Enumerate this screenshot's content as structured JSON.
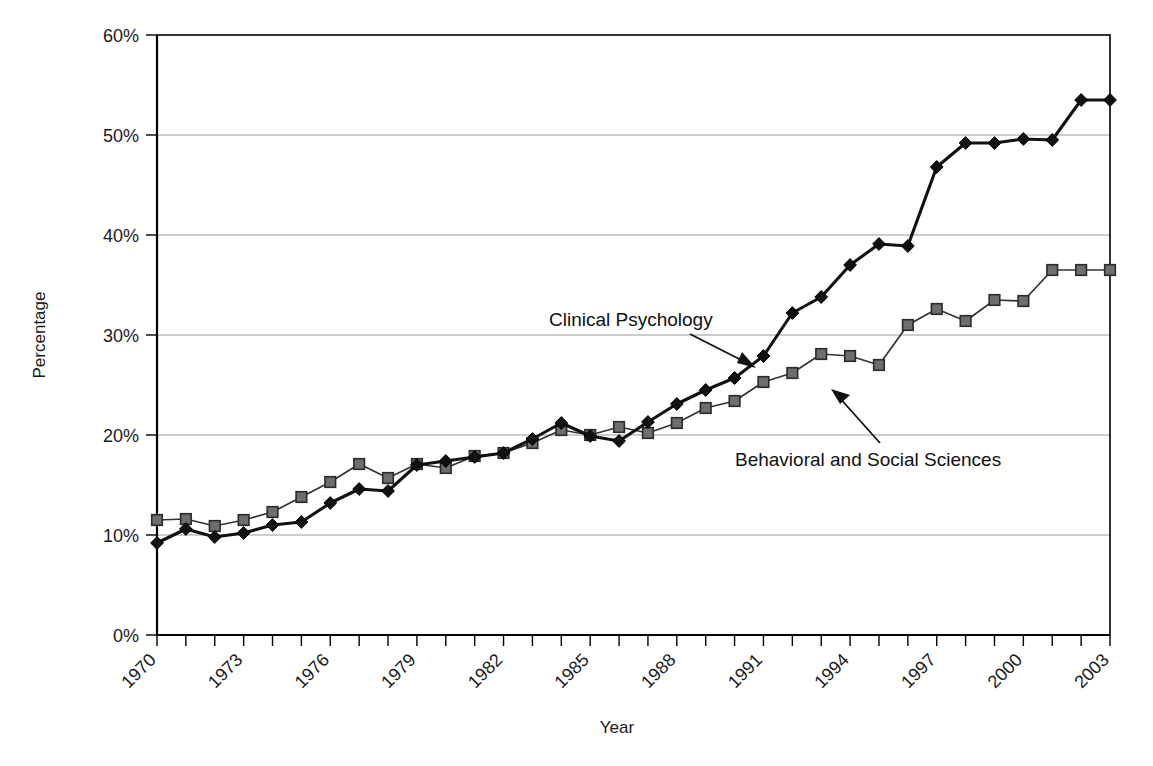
{
  "chart_data": {
    "type": "line",
    "title": "",
    "xlabel": "Year",
    "ylabel": "Percentage",
    "xlim": [
      1970,
      2003
    ],
    "ylim": [
      0,
      60
    ],
    "ytick_labels": [
      "0%",
      "10%",
      "20%",
      "30%",
      "40%",
      "50%",
      "60%"
    ],
    "ytick_values": [
      0,
      10,
      20,
      30,
      40,
      50,
      60
    ],
    "xtick_labels": [
      "1970",
      "1973",
      "1976",
      "1979",
      "1982",
      "1985",
      "1988",
      "1991",
      "1994",
      "1997",
      "2000",
      "2003"
    ],
    "xtick_values": [
      1970,
      1973,
      1976,
      1979,
      1982,
      1985,
      1988,
      1991,
      1994,
      1997,
      2000,
      2003
    ],
    "minor_xticks_every": 1,
    "grid": "horizontal",
    "legend": "inline-annotations",
    "x": [
      1970,
      1971,
      1972,
      1973,
      1974,
      1975,
      1976,
      1977,
      1978,
      1979,
      1980,
      1981,
      1982,
      1983,
      1984,
      1985,
      1986,
      1987,
      1988,
      1989,
      1990,
      1991,
      1992,
      1993,
      1994,
      1995,
      1996,
      1997,
      1998,
      1999,
      2000,
      2001,
      2002,
      2003
    ],
    "series": [
      {
        "name": "Clinical Psychology",
        "marker": "diamond",
        "color": "#111111",
        "values": [
          9.2,
          10.6,
          9.8,
          10.2,
          11.0,
          11.3,
          13.2,
          14.6,
          14.4,
          17.0,
          17.4,
          17.8,
          18.2,
          19.6,
          21.2,
          19.9,
          19.4,
          21.3,
          23.1,
          24.5,
          25.7,
          27.9,
          32.2,
          33.8,
          37.0,
          39.1,
          38.9,
          46.8,
          49.2,
          49.2,
          49.6,
          49.5,
          53.5,
          53.5
        ]
      },
      {
        "name": "Behavioral and Social Sciences",
        "marker": "square",
        "color": "#6e6e6e",
        "values": [
          11.5,
          11.6,
          10.9,
          11.5,
          12.3,
          13.8,
          15.3,
          17.1,
          15.7,
          17.1,
          16.7,
          17.9,
          18.2,
          19.2,
          20.5,
          20.0,
          20.8,
          20.2,
          21.2,
          22.7,
          23.4,
          25.3,
          26.2,
          28.1,
          27.9,
          27.0,
          31.0,
          32.6,
          31.4,
          33.5,
          33.4,
          36.5,
          36.5,
          36.5
        ]
      }
    ],
    "annotations": [
      {
        "text": "Clinical Psychology",
        "points_to_series": "Clinical Psychology"
      },
      {
        "text": "Behavioral and Social Sciences",
        "points_to_series": "Behavioral and Social Sciences"
      }
    ]
  },
  "axes": {
    "y_title": "Percentage",
    "x_title": "Year"
  },
  "annotations": {
    "clinical": "Clinical Psychology",
    "behavioral": "Behavioral and Social Sciences"
  }
}
